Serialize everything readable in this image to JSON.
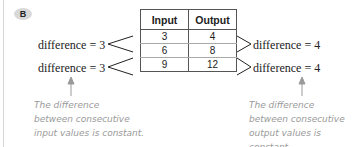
{
  "badge": {
    "label": "B",
    "color": "#d8d8d8"
  },
  "table": {
    "headers": [
      "Input",
      "Output"
    ],
    "rows": [
      [
        "3",
        "4"
      ],
      [
        "6",
        "8"
      ],
      [
        "9",
        "12"
      ]
    ]
  },
  "left_differences": [
    "difference = 3",
    "difference = 3"
  ],
  "right_differences": [
    "difference = 4",
    "difference = 4"
  ],
  "notes": {
    "left": [
      "The difference",
      "between consecutive",
      "input values is constant."
    ],
    "right": [
      "The difference",
      "between consecutive",
      "output values is",
      "constant."
    ]
  },
  "colors": {
    "note_text": "#9a9a9a",
    "arrow": "#9a9a9a",
    "line": "#222222"
  }
}
